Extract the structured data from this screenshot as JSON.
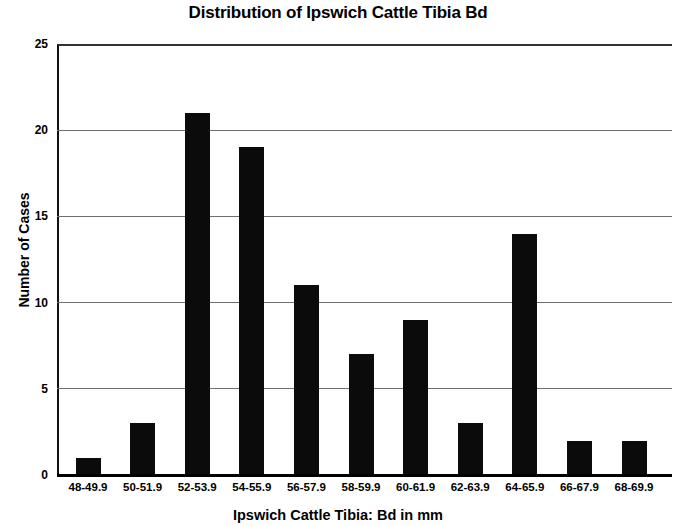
{
  "chart_data": {
    "type": "bar",
    "title": "Distribution of Ipswich Cattle Tibia Bd",
    "xlabel": "Ipswich Cattle Tibia: Bd in mm",
    "ylabel": "Number of Cases",
    "categories": [
      "48-49.9",
      "50-51.9",
      "52-53.9",
      "54-55.9",
      "56-57.9",
      "58-59.9",
      "60-61.9",
      "62-63.9",
      "64-65.9",
      "66-67.9",
      "68-69.9"
    ],
    "values": [
      1,
      3,
      21,
      19,
      11,
      7,
      9,
      3,
      14,
      2,
      2
    ],
    "ylim": [
      0,
      25
    ],
    "yticks": [
      "0",
      "5",
      "10",
      "15",
      "20",
      "25"
    ],
    "ytick_values": [
      0,
      5,
      10,
      15,
      20,
      25
    ],
    "grid": "horizontal",
    "legend": "none",
    "bar_color": "#0b0b0b",
    "gridline_color": "#6f6f6f",
    "axis_color": "#000000",
    "background_color": "#ffffff"
  }
}
